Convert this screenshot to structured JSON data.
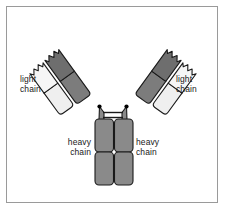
{
  "figure": {
    "kind": "schematic-diagram",
    "background_color": "#ffffff",
    "frame_color": "#9a9a9a",
    "outline_color": "#1a1a1a",
    "labels": {
      "light_chain_left": "light\nchain",
      "light_chain_right": "light\nchain",
      "heavy_chain_left": "heavy\nchain",
      "heavy_chain_right": "heavy\nchain"
    },
    "colors": {
      "heavy_chain_arm": "#7c7c7c",
      "heavy_chain_arm_upper": "#6e6e6e",
      "light_chain_arm": "#efefef",
      "light_chain_arm_upper": "#f6f6f6",
      "heavy_chain_stem": "#8a8a8a",
      "hinge_line": "#1a1a1a",
      "joint_dot": "#000000"
    },
    "parts": [
      {
        "name": "left-arm-heavy-chain",
        "chain": "heavy",
        "domains": 2,
        "shade": "dark"
      },
      {
        "name": "left-arm-light-chain",
        "chain": "light",
        "domains": 2,
        "shade": "light"
      },
      {
        "name": "right-arm-heavy-chain",
        "chain": "heavy",
        "domains": 2,
        "shade": "dark"
      },
      {
        "name": "right-arm-light-chain",
        "chain": "light",
        "domains": 2,
        "shade": "light"
      },
      {
        "name": "stem-heavy-chain-left",
        "chain": "heavy",
        "domains": 2,
        "shade": "medium"
      },
      {
        "name": "stem-heavy-chain-right",
        "chain": "heavy",
        "domains": 2,
        "shade": "medium"
      },
      {
        "name": "hinge-disulfide-bonds",
        "count": 2
      }
    ]
  }
}
